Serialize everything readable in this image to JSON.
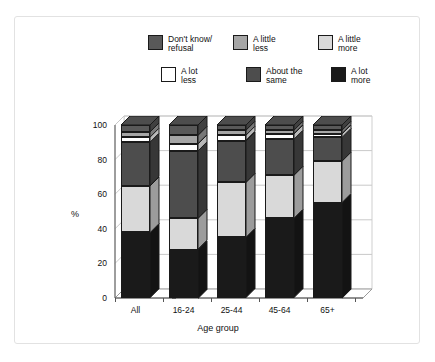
{
  "chart_data": {
    "type": "bar",
    "subtype": "stacked-bar-3d",
    "title": "",
    "xlabel": "Age group",
    "ylabel": "%",
    "ylim": [
      0,
      100
    ],
    "yticks": [
      0,
      20,
      40,
      60,
      80,
      100
    ],
    "grid": true,
    "legend_position": "top",
    "categories": [
      "All",
      "16-24",
      "25-44",
      "45-64",
      "65+"
    ],
    "series": [
      {
        "name": "A lot more",
        "color": "#1a1a1a",
        "values": [
          38,
          28,
          35,
          46,
          55
        ]
      },
      {
        "name": "A little more",
        "color": "#d9d9d9",
        "values": [
          27,
          18,
          32,
          25,
          24
        ]
      },
      {
        "name": "About the same",
        "color": "#4d4d4d",
        "values": [
          25,
          39,
          24,
          21,
          14
        ]
      },
      {
        "name": "A lot less",
        "color": "#ffffff",
        "values": [
          3,
          4,
          3,
          3,
          2
        ]
      },
      {
        "name": "A little less",
        "color": "#a6a6a6",
        "values": [
          3,
          5,
          3,
          2,
          2
        ]
      },
      {
        "name": "Don't know/refusal",
        "color": "#595959",
        "values": [
          4,
          6,
          3,
          3,
          3
        ]
      }
    ]
  },
  "legend": {
    "row1": [
      {
        "label": "Don't know/\nrefusal",
        "color": "#595959"
      },
      {
        "label": "A little\nless",
        "color": "#a6a6a6"
      },
      {
        "label": "A little\nmore",
        "color": "#d9d9d9"
      }
    ],
    "row2": [
      {
        "label": "A lot\nless",
        "color": "#ffffff"
      },
      {
        "label": "About the\nsame",
        "color": "#4d4d4d"
      },
      {
        "label": "A lot\nmore",
        "color": "#1a1a1a"
      }
    ]
  }
}
